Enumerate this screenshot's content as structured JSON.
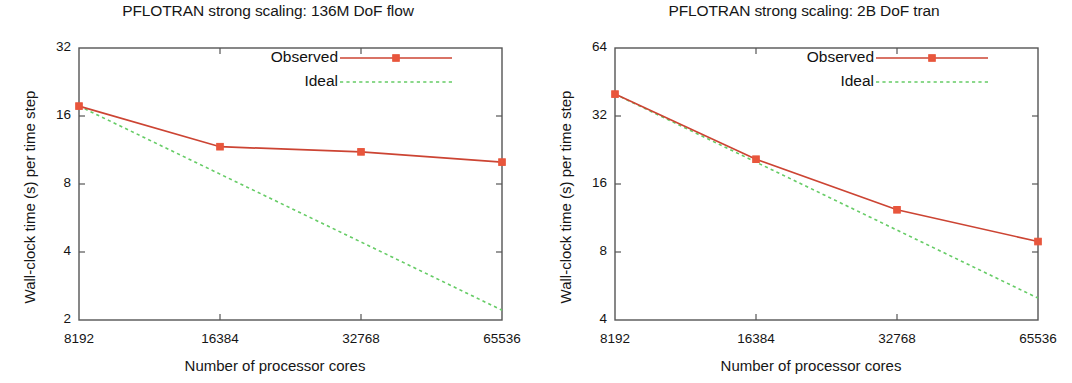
{
  "figure": {
    "width": 1072,
    "height": 383,
    "background": "#ffffff",
    "panel_count": 2
  },
  "colors": {
    "observed": "#cc4433",
    "observed_marker": "#e8563c",
    "ideal": "#66cc66",
    "axis": "#555555",
    "text": "#161616"
  },
  "common": {
    "xlabel": "Number of processor cores",
    "ylabel": "Wall-clock time (s) per time step",
    "legend": {
      "observed_label": "Observed",
      "ideal_label": "Ideal"
    },
    "xtick_labels": [
      "8192",
      "16384",
      "32768",
      "65536"
    ]
  },
  "chart_data": [
    {
      "type": "line",
      "id": "flow",
      "title": "PFLOTRAN strong scaling: 136M DoF flow",
      "xlabel": "Number of processor cores",
      "ylabel": "Wall-clock time (s) per time step",
      "xscale": "log2",
      "yscale": "log2",
      "x": [
        8192,
        16384,
        32768,
        65536
      ],
      "xtick_labels": [
        "8192",
        "16384",
        "32768",
        "65536"
      ],
      "xlim": [
        8192,
        65536
      ],
      "ylim": [
        2,
        32
      ],
      "ytick_labels": [
        "32",
        "16",
        "8",
        "4",
        "2"
      ],
      "yticks": [
        32,
        16,
        8,
        4,
        2
      ],
      "grid": false,
      "legend_position": "top-right",
      "series": [
        {
          "name": "Observed",
          "style": "solid-with-square-markers",
          "color": "#cc4433",
          "values": [
            17.7,
            11.7,
            11.1,
            10.0
          ]
        },
        {
          "name": "Ideal",
          "style": "dotted",
          "color": "#66cc66",
          "values": [
            17.7,
            8.85,
            4.43,
            2.21
          ]
        }
      ]
    },
    {
      "type": "line",
      "id": "tran",
      "title": "PFLOTRAN strong scaling: 2B DoF tran",
      "xlabel": "Number of processor cores",
      "ylabel": "Wall-clock time (s) per time step",
      "xscale": "log2",
      "yscale": "log2",
      "x": [
        8192,
        16384,
        32768,
        65536
      ],
      "xtick_labels": [
        "8192",
        "16384",
        "32768",
        "65536"
      ],
      "xlim": [
        8192,
        65536
      ],
      "ylim": [
        4,
        64
      ],
      "ytick_labels": [
        "64",
        "32",
        "16",
        "8",
        "4"
      ],
      "yticks": [
        64,
        32,
        16,
        8,
        4
      ],
      "grid": false,
      "legend_position": "top-right",
      "series": [
        {
          "name": "Observed",
          "style": "solid-with-square-markers",
          "color": "#cc4433",
          "values": [
            40.0,
            20.6,
            12.3,
            8.9
          ]
        },
        {
          "name": "Ideal",
          "style": "dotted",
          "color": "#66cc66",
          "values": [
            40.0,
            20.0,
            10.0,
            5.0
          ]
        }
      ]
    }
  ]
}
